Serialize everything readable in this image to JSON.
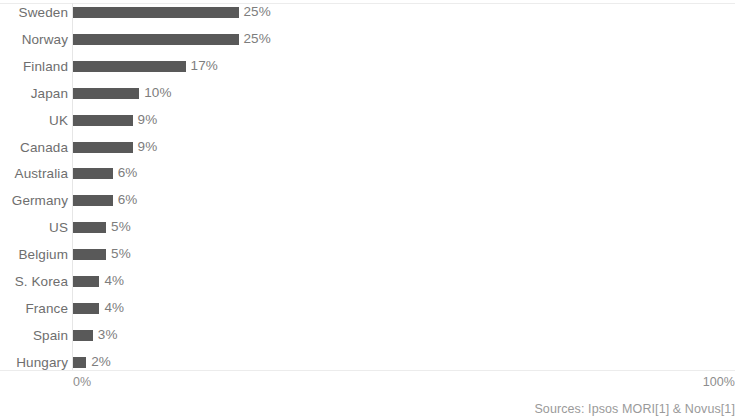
{
  "chart_data": {
    "type": "bar",
    "orientation": "horizontal",
    "title": "",
    "subtitle": "",
    "xlabel": "",
    "ylabel": "",
    "xlim": [
      0,
      100
    ],
    "grid": false,
    "legend": null,
    "categories": [
      "Sweden",
      "Norway",
      "Finland",
      "Japan",
      "UK",
      "Canada",
      "Australia",
      "Germany",
      "US",
      "Belgium",
      "S. Korea",
      "France",
      "Spain",
      "Hungary"
    ],
    "values": [
      25,
      25,
      17,
      10,
      9,
      9,
      6,
      6,
      5,
      5,
      4,
      4,
      3,
      2
    ],
    "value_labels": [
      "25%",
      "25%",
      "17%",
      "10%",
      "9%",
      "9%",
      "6%",
      "6%",
      "5%",
      "5%",
      "4%",
      "4%",
      "3%",
      "2%"
    ],
    "bar_color": "#595959",
    "label_color": "#6e6e6e",
    "value_label_color": "#7d7d7d"
  },
  "axis": {
    "x_ticks": [
      "0%",
      "100%"
    ],
    "x_tick_min": "0%",
    "x_tick_max": "100%",
    "tick_color": "#8d8d8d"
  },
  "footer": {
    "sources": "Sources: Ipsos MORI[1] & Novus[1]"
  }
}
